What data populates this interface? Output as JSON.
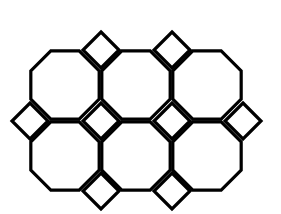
{
  "figure": {
    "name": "truncated-square-tiling",
    "title": "Truncated square tiling pattern",
    "canvas": {
      "width": 281,
      "height": 214,
      "background_color": "#ffffff"
    },
    "style": {
      "stroke_color": "#000000",
      "fill_color": "#ffffff",
      "stroke_width": 3.2
    },
    "geometry": {
      "grid_pitch": 71,
      "octagon_circumradius": 37,
      "octagon_side": 28,
      "square_half_diagonal": 18,
      "octagon_center_origin_x": 65,
      "octagon_center_origin_y": 85,
      "square_center_origin_x": 29.5,
      "square_center_origin_y": 49.5
    },
    "octagons": [
      {
        "id": "octagon-r0-c0",
        "cx": 65,
        "cy": 85,
        "row": 0,
        "col": 0
      },
      {
        "id": "octagon-r0-c1",
        "cx": 136,
        "cy": 85,
        "row": 0,
        "col": 1
      },
      {
        "id": "octagon-r0-c2",
        "cx": 207,
        "cy": 85,
        "row": 0,
        "col": 2
      },
      {
        "id": "octagon-r1-c0",
        "cx": 65,
        "cy": 156,
        "row": 1,
        "col": 0
      },
      {
        "id": "octagon-r1-c1",
        "cx": 136,
        "cy": 156,
        "row": 1,
        "col": 1
      },
      {
        "id": "octagon-r1-c2",
        "cx": 207,
        "cy": 156,
        "row": 1,
        "col": 2
      }
    ],
    "squares": [
      {
        "id": "square-r0-c1",
        "cx": 101,
        "cy": 50,
        "row": 0,
        "col": 1
      },
      {
        "id": "square-r0-c2",
        "cx": 172,
        "cy": 50,
        "row": 0,
        "col": 2
      },
      {
        "id": "square-r1-c0",
        "cx": 30,
        "cy": 121,
        "row": 1,
        "col": 0
      },
      {
        "id": "square-r1-c1",
        "cx": 101,
        "cy": 121,
        "row": 1,
        "col": 1
      },
      {
        "id": "square-r1-c2",
        "cx": 172,
        "cy": 121,
        "row": 1,
        "col": 2
      },
      {
        "id": "square-r1-c3",
        "cx": 243,
        "cy": 121,
        "row": 1,
        "col": 3
      },
      {
        "id": "square-r2-c1",
        "cx": 101,
        "cy": 191,
        "row": 2,
        "col": 1
      },
      {
        "id": "square-r2-c2",
        "cx": 172,
        "cy": 191,
        "row": 2,
        "col": 2
      }
    ],
    "counts": {
      "octagons": 6,
      "squares": 8,
      "octagon_rows": 2,
      "octagon_columns": 3
    }
  }
}
